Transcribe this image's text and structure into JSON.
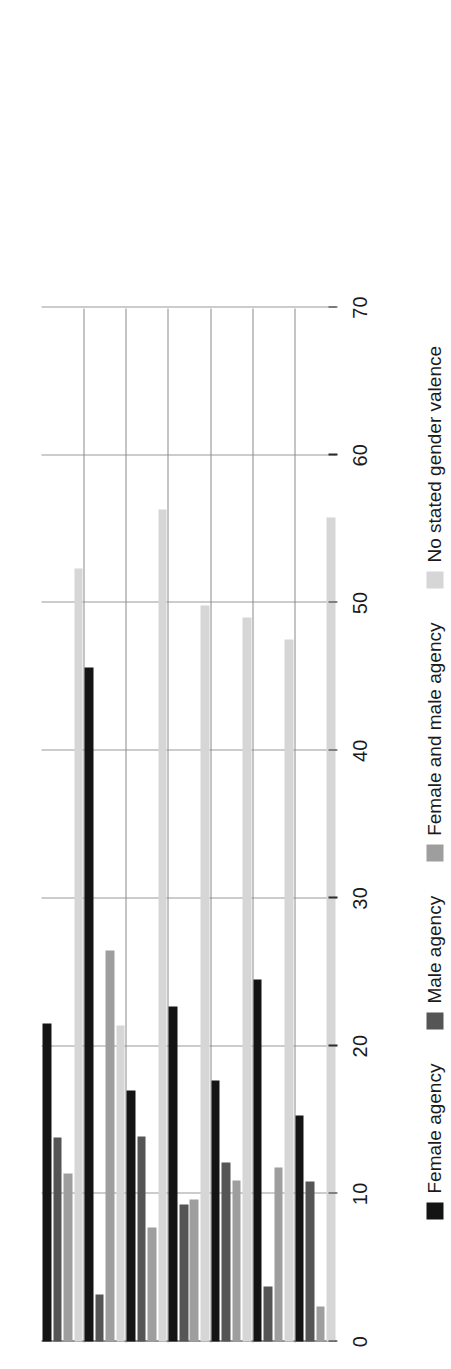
{
  "chart_data": {
    "type": "bar",
    "orientation": "horizontal-rotated",
    "title": "",
    "xlabel": "",
    "ylabel": "",
    "ylim": [
      0,
      70
    ],
    "ticks": [
      0,
      10,
      20,
      30,
      40,
      50,
      60,
      70
    ],
    "tick_labels": [
      "0",
      "10",
      "20",
      "30",
      "40",
      "50",
      "60",
      "70"
    ],
    "grid": true,
    "legend_position": "bottom",
    "categories": [
      "All (605)",
      "Female (74)",
      "Male/likely male\n(531)",
      "Male nonjournalist\n(134)",
      "Support pronatalism\n(335)",
      "Oppose pronatalism\n(92)",
      "Neutral/ambivalent\n(178)"
    ],
    "series": [
      {
        "name": "Female agency",
        "color": "#141414",
        "values": [
          21.5,
          45.6,
          17.0,
          22.7,
          17.7,
          24.5,
          15.3
        ]
      },
      {
        "name": "Male agency",
        "color": "#555555",
        "values": [
          13.8,
          3.2,
          13.9,
          9.3,
          12.1,
          3.7,
          10.8
        ]
      },
      {
        "name": "Female and male agency",
        "color": "#9e9e9e",
        "values": [
          11.4,
          26.5,
          7.7,
          9.6,
          10.9,
          11.8,
          2.4
        ]
      },
      {
        "name": "No stated gender valence",
        "color": "#d6d6d6",
        "values": [
          52.3,
          21.4,
          56.3,
          49.8,
          49.0,
          47.5,
          55.8
        ]
      }
    ]
  },
  "legend": {
    "items": [
      "Female agency",
      "Male agency",
      "Female and male agency",
      "No stated gender valence"
    ]
  },
  "axis": {
    "tick_labels": [
      "0",
      "10",
      "20",
      "30",
      "40",
      "50",
      "60",
      "70"
    ]
  }
}
